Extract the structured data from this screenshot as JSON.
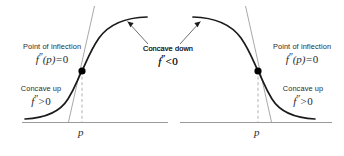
{
  "figure": {
    "background_color": "#ffffff",
    "curve_color": "#1a1a1a",
    "tangent_color": "#8e8e8e",
    "axis_color": "#9a9a9a",
    "dashed_color": "#a8a8a8",
    "point_color": "#000000",
    "text_color": "#2a2a2a",
    "width": 344,
    "height": 156
  },
  "panels": [
    {
      "id": "left",
      "description": "increasing S-shaped curve, concave up then concave down",
      "axis_tick_label": "p",
      "inflection": {
        "title": "Point of inflection",
        "formula_f": "f",
        "formula_primes": "″",
        "formula_arg": "(p)",
        "formula_rel": "=",
        "formula_value": "0",
        "formula_plain": "f″(p) = 0"
      },
      "region_lower": {
        "title": "Concave up",
        "formula_f": "f",
        "formula_primes": "″",
        "formula_rel": ">",
        "formula_value": "0",
        "formula_plain": "f″ > 0"
      },
      "region_upper": {
        "title": "Concave down",
        "formula_f": "f",
        "formula_primes": "″",
        "formula_rel": "<",
        "formula_value": "0",
        "formula_plain": "f″ < 0"
      }
    },
    {
      "id": "right",
      "description": "decreasing S-shaped curve, concave down then concave up",
      "axis_tick_label": "p",
      "inflection": {
        "title": "Point of inflection",
        "formula_f": "f",
        "formula_primes": "″",
        "formula_arg": "(p)",
        "formula_rel": "=",
        "formula_value": "0",
        "formula_plain": "f″(p) = 0"
      },
      "region_lower": {
        "title": "Concave up",
        "formula_f": "f",
        "formula_primes": "″",
        "formula_rel": ">",
        "formula_value": "0",
        "formula_plain": "f″ > 0"
      },
      "region_upper": {
        "title": "Concave down",
        "formula_f": "f",
        "formula_primes": "″",
        "formula_rel": "<",
        "formula_value": "0",
        "formula_plain": "f″ < 0"
      }
    }
  ]
}
